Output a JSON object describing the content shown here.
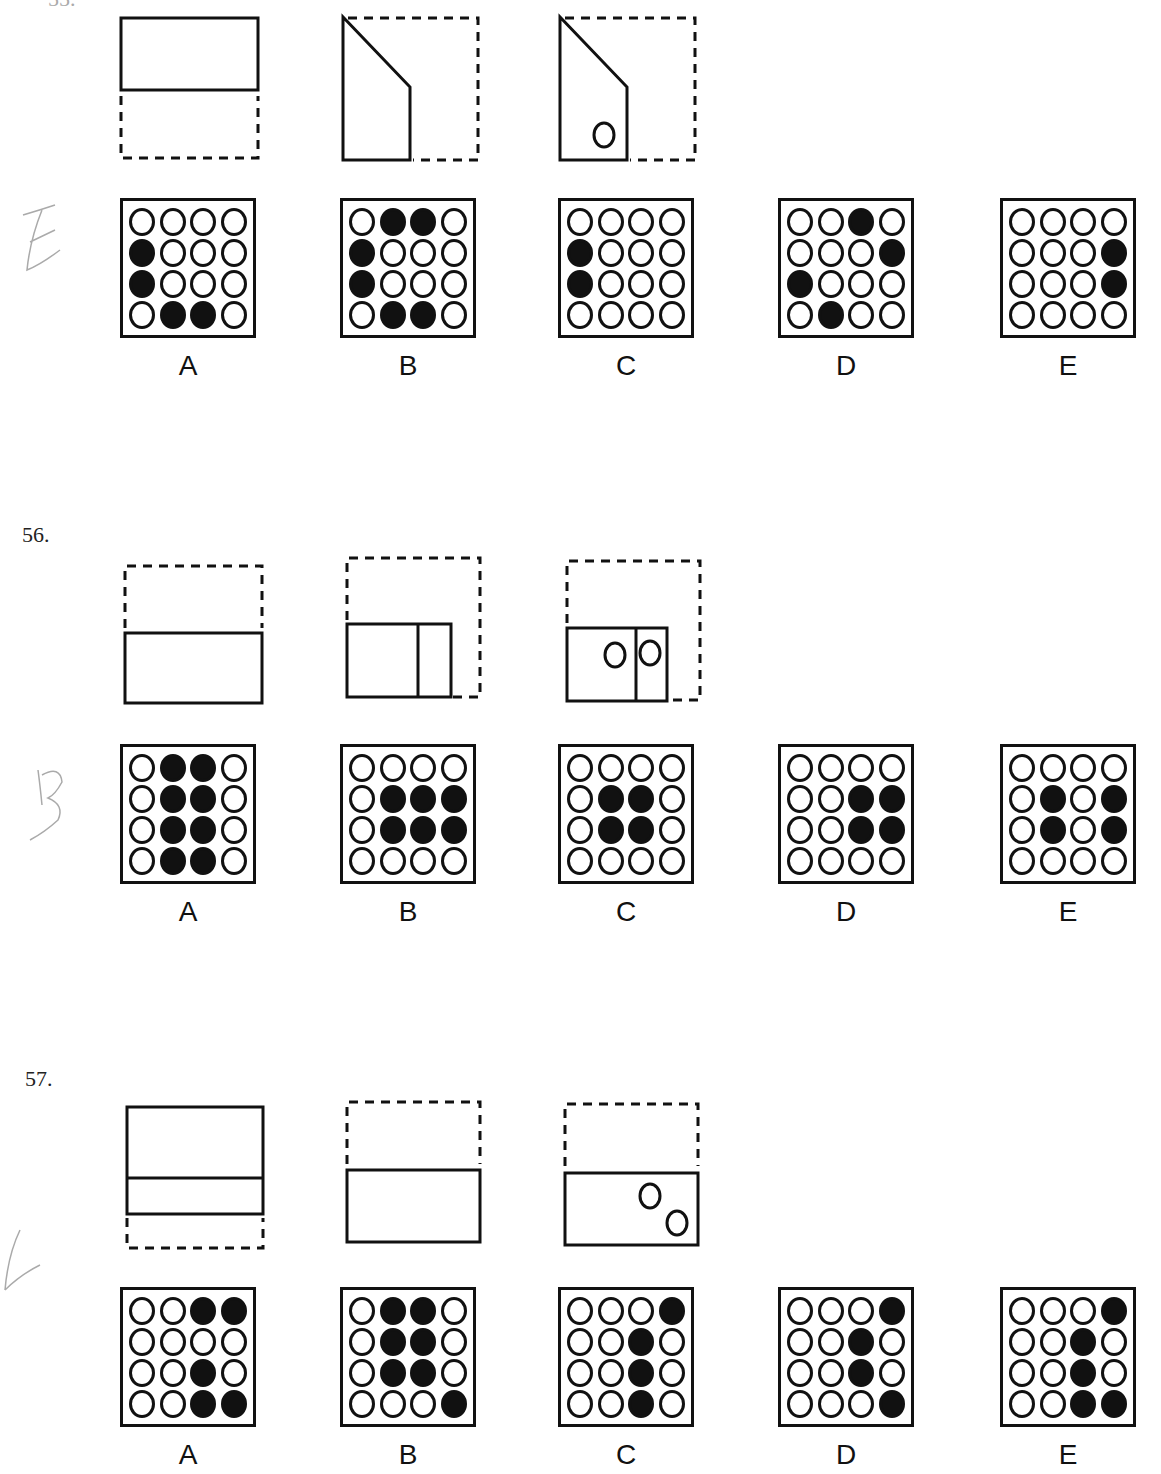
{
  "page": {
    "partial_header": "55.",
    "questions": [
      {
        "number": "",
        "handwritten_answer": "E",
        "options": [
          {
            "label": "A",
            "grid": [
              [
                0,
                0,
                0,
                0
              ],
              [
                1,
                0,
                0,
                0
              ],
              [
                1,
                0,
                0,
                0
              ],
              [
                0,
                1,
                1,
                0
              ]
            ]
          },
          {
            "label": "B",
            "grid": [
              [
                0,
                1,
                1,
                0
              ],
              [
                1,
                0,
                0,
                0
              ],
              [
                1,
                0,
                0,
                0
              ],
              [
                0,
                1,
                1,
                0
              ]
            ]
          },
          {
            "label": "C",
            "grid": [
              [
                0,
                0,
                0,
                0
              ],
              [
                1,
                0,
                0,
                0
              ],
              [
                1,
                0,
                0,
                0
              ],
              [
                0,
                0,
                0,
                0
              ]
            ]
          },
          {
            "label": "D",
            "grid": [
              [
                0,
                0,
                1,
                0
              ],
              [
                0,
                0,
                0,
                1
              ],
              [
                1,
                0,
                0,
                0
              ],
              [
                0,
                1,
                0,
                0
              ]
            ]
          },
          {
            "label": "E",
            "grid": [
              [
                0,
                0,
                0,
                0
              ],
              [
                0,
                0,
                0,
                1
              ],
              [
                0,
                0,
                0,
                1
              ],
              [
                0,
                0,
                0,
                0
              ]
            ]
          }
        ]
      },
      {
        "number": "56.",
        "handwritten_answer": "B",
        "options": [
          {
            "label": "A",
            "grid": [
              [
                0,
                1,
                1,
                0
              ],
              [
                0,
                1,
                1,
                0
              ],
              [
                0,
                1,
                1,
                0
              ],
              [
                0,
                1,
                1,
                0
              ]
            ]
          },
          {
            "label": "B",
            "grid": [
              [
                0,
                0,
                0,
                0
              ],
              [
                0,
                1,
                1,
                1
              ],
              [
                0,
                1,
                1,
                1
              ],
              [
                0,
                0,
                0,
                0
              ]
            ]
          },
          {
            "label": "C",
            "grid": [
              [
                0,
                0,
                0,
                0
              ],
              [
                0,
                1,
                1,
                0
              ],
              [
                0,
                1,
                1,
                0
              ],
              [
                0,
                0,
                0,
                0
              ]
            ]
          },
          {
            "label": "D",
            "grid": [
              [
                0,
                0,
                0,
                0
              ],
              [
                0,
                0,
                1,
                1
              ],
              [
                0,
                0,
                1,
                1
              ],
              [
                0,
                0,
                0,
                0
              ]
            ]
          },
          {
            "label": "E",
            "grid": [
              [
                0,
                0,
                0,
                0
              ],
              [
                0,
                1,
                0,
                1
              ],
              [
                0,
                1,
                0,
                1
              ],
              [
                0,
                0,
                0,
                0
              ]
            ]
          }
        ]
      },
      {
        "number": "57.",
        "handwritten_answer": "C",
        "options": [
          {
            "label": "A",
            "grid": [
              [
                0,
                0,
                1,
                1
              ],
              [
                0,
                0,
                0,
                0
              ],
              [
                0,
                0,
                1,
                0
              ],
              [
                0,
                0,
                1,
                1
              ]
            ]
          },
          {
            "label": "B",
            "grid": [
              [
                0,
                1,
                1,
                0
              ],
              [
                0,
                1,
                1,
                0
              ],
              [
                0,
                1,
                1,
                0
              ],
              [
                0,
                0,
                0,
                1
              ]
            ]
          },
          {
            "label": "C",
            "grid": [
              [
                0,
                0,
                0,
                1
              ],
              [
                0,
                0,
                1,
                0
              ],
              [
                0,
                0,
                1,
                0
              ],
              [
                0,
                0,
                1,
                0
              ]
            ]
          },
          {
            "label": "D",
            "grid": [
              [
                0,
                0,
                0,
                1
              ],
              [
                0,
                0,
                1,
                0
              ],
              [
                0,
                0,
                1,
                0
              ],
              [
                0,
                0,
                0,
                1
              ]
            ]
          },
          {
            "label": "E",
            "grid": [
              [
                0,
                0,
                0,
                1
              ],
              [
                0,
                0,
                1,
                0
              ],
              [
                0,
                0,
                1,
                0
              ],
              [
                0,
                0,
                1,
                1
              ]
            ]
          }
        ]
      }
    ]
  }
}
